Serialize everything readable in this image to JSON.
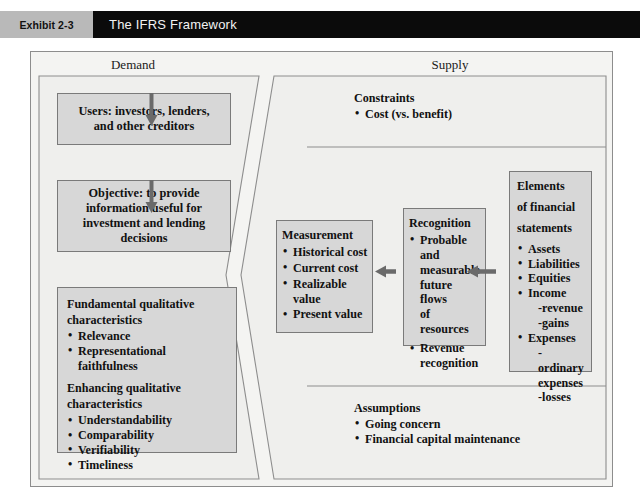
{
  "header": {
    "exhibit_number": "Exhibit 2-3",
    "title": "The IFRS Framework"
  },
  "panels": {
    "demand": {
      "title": "Demand"
    },
    "supply": {
      "title": "Supply"
    }
  },
  "demand": {
    "users": {
      "line1": "Users: investors, lenders,",
      "line2": "and other creditors"
    },
    "objective": {
      "line1": "Objective: to provide",
      "line2": "information useful for",
      "line3": "investment and lending",
      "line4": "decisions"
    },
    "qualitative": {
      "fundamental_heading_line1": "Fundamental qualitative",
      "fundamental_heading_line2": "characteristics",
      "fundamental_items": [
        "Relevance",
        "Representational faithfulness"
      ],
      "enhancing_heading_line1": "Enhancing qualitative",
      "enhancing_heading_line2": "characteristics",
      "enhancing_items": [
        "Understandability",
        "Comparability",
        "Verifiability",
        "Timeliness"
      ]
    }
  },
  "supply": {
    "constraints": {
      "heading": "Constraints",
      "items": [
        "Cost (vs. benefit)"
      ]
    },
    "elements": {
      "heading_line1": "Elements",
      "heading_line2": "of financial",
      "heading_line3": "statements",
      "items": [
        {
          "label": "Assets",
          "sub": []
        },
        {
          "label": "Liabilities",
          "sub": []
        },
        {
          "label": "Equities",
          "sub": []
        },
        {
          "label": "Income",
          "sub": [
            "-revenue",
            "-gains"
          ]
        },
        {
          "label": "Expenses",
          "sub": [
            "-ordinary",
            "expenses",
            "-losses"
          ]
        }
      ]
    },
    "recognition": {
      "heading": "Recognition",
      "items": [
        {
          "line1": "Probable and",
          "rest": [
            "measurable",
            "future flows",
            "of resources"
          ]
        },
        {
          "line1": "Revenue",
          "rest": [
            "recognition"
          ]
        }
      ]
    },
    "measurement": {
      "heading": "Measurement",
      "items": [
        {
          "line1": "Historical cost",
          "rest": []
        },
        {
          "line1": "Current cost",
          "rest": []
        },
        {
          "line1": "Realizable",
          "rest": [
            "value"
          ]
        },
        {
          "line1": "Present value",
          "rest": []
        }
      ]
    },
    "assumptions": {
      "heading": "Assumptions",
      "items": [
        "Going concern",
        "Financial capital maintenance"
      ]
    }
  },
  "glyphs": {
    "bullet": "•"
  },
  "colors": {
    "header_band": "#0b0b0b",
    "exhibit_tag": "#b9b9b9",
    "box_fill": "#d7d7d7",
    "box_border": "#7a7a7a",
    "panel_bg": "#f4f4f2",
    "frame_border": "#8d8d8d",
    "arrow": "#6a6a6a"
  }
}
